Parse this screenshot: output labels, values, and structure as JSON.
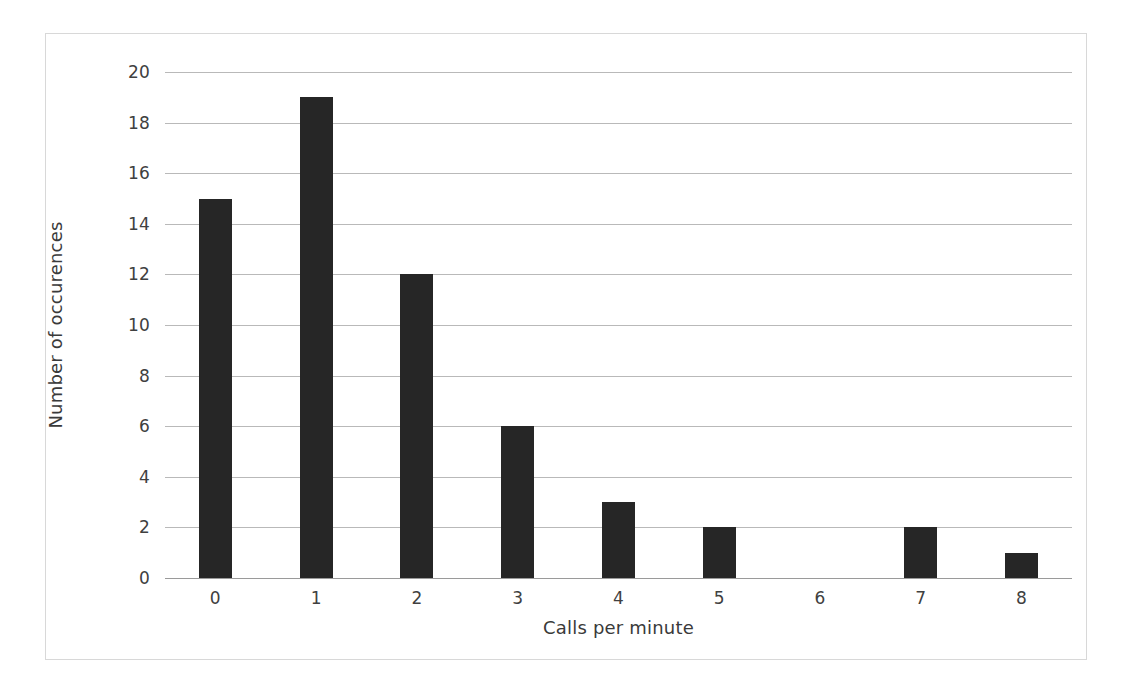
{
  "chart_data": {
    "type": "bar",
    "title": "",
    "subtitle": "",
    "xlabel": "Calls per minute",
    "ylabel": "Number of occurences",
    "categories": [
      "0",
      "1",
      "2",
      "3",
      "4",
      "5",
      "6",
      "7",
      "8"
    ],
    "values": [
      15,
      19,
      12,
      6,
      3,
      2,
      0,
      2,
      1
    ],
    "series": [
      {
        "name": "Number of occurences",
        "values": [
          15,
          19,
          12,
          6,
          3,
          2,
          0,
          2,
          1
        ]
      }
    ],
    "ylim": [
      0,
      20
    ],
    "ytick_labels": [
      "0",
      "2",
      "4",
      "6",
      "8",
      "10",
      "12",
      "14",
      "16",
      "18",
      "20"
    ],
    "ytick_values": [
      0,
      2,
      4,
      6,
      8,
      10,
      12,
      14,
      16,
      18,
      20
    ],
    "xtick_labels": [
      "0",
      "1",
      "2",
      "3",
      "4",
      "5",
      "6",
      "7",
      "8"
    ],
    "grid": "horizontal",
    "legend": "none",
    "annotations": [],
    "colors": {
      "bar": "#262626",
      "gridline": "#b9b9b9",
      "axis_line": "#9a9a9a",
      "border": "#d8d8d8",
      "text": "#404040",
      "background": "#ffffff"
    }
  }
}
